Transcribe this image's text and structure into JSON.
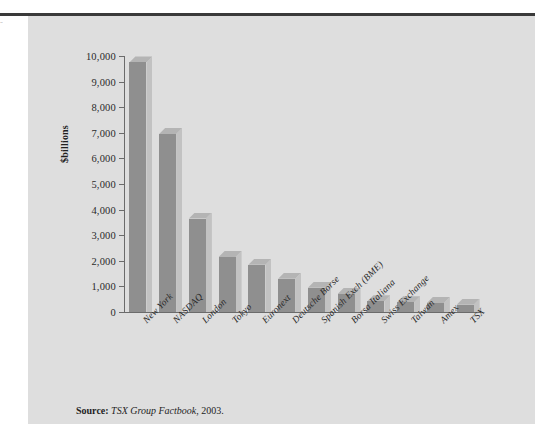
{
  "figure": {
    "margin_artifact": "=",
    "source": {
      "label": "Source:",
      "title": "TSX Group Factbook",
      "year": ", 2003."
    }
  },
  "chart_data": {
    "type": "bar",
    "title": "",
    "xlabel": "",
    "ylabel": "$billions",
    "ylim": [
      0,
      10000
    ],
    "ytick_labels": [
      "10,000",
      "9,000",
      "8,000",
      "7,000",
      "6,000",
      "5,000",
      "4,000",
      "3,000",
      "2,000",
      "1,000",
      "0"
    ],
    "ytick_values": [
      10000,
      9000,
      8000,
      7000,
      6000,
      5000,
      4000,
      3000,
      2000,
      1000,
      0
    ],
    "grid": false,
    "legend": null,
    "categories": [
      "New York",
      "NASDAQ",
      "London",
      "Tokyo",
      "Euronext",
      "Deutsche Borse",
      "Spanish Exch (BME)",
      "Borsa Italiana",
      "Swiss Exchange",
      "Taiwan",
      "Amex",
      "TSX"
    ],
    "values": [
      9750,
      6950,
      3650,
      2150,
      1850,
      1300,
      950,
      700,
      420,
      380,
      350,
      280
    ],
    "bar_color": "#8f8f8f",
    "panel_color": "#dedede"
  }
}
